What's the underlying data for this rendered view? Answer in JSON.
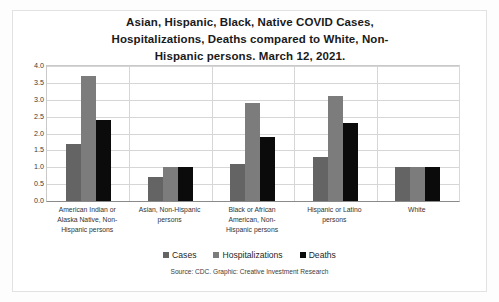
{
  "chart_data": {
    "type": "bar",
    "title_lines": [
      "Asian, Hispanic, Black, Native COVID Cases,",
      "Hospitalizations,  Deaths compared to White, Non-",
      "Hispanic persons. March 12, 2021."
    ],
    "xlabel": "",
    "ylabel": "",
    "ylim": [
      0,
      4.0
    ],
    "ytick_step": 0.5,
    "grid": true,
    "legend_position": "bottom",
    "categories": [
      "American Indian or Alaska Native, Non-Hispanic persons",
      "Asian, Non-Hispanic persons",
      "Black or African American, Non-Hispanic persons",
      "Hispanic or Latino persons",
      "White"
    ],
    "category_lines": [
      [
        "American Indian or",
        "Alaska Native, Non-",
        "Hispanic persons"
      ],
      [
        "Asian, Non-Hispanic",
        "persons"
      ],
      [
        "Black or African",
        "American, Non-",
        "Hispanic persons"
      ],
      [
        "Hispanic or Latino",
        "persons"
      ],
      [
        "White"
      ]
    ],
    "series": [
      {
        "name": "Cases",
        "color": "#646464",
        "values": [
          1.7,
          0.7,
          1.1,
          1.3,
          1.0
        ]
      },
      {
        "name": "Hospitalizations",
        "color": "#7c7c7c",
        "values": [
          3.7,
          1.0,
          2.9,
          3.1,
          1.0
        ]
      },
      {
        "name": "Deaths",
        "color": "#0b0b0b",
        "values": [
          2.4,
          1.0,
          1.9,
          2.3,
          1.0
        ]
      }
    ],
    "yticks": [
      "0.0",
      "0.5",
      "1.0",
      "1.5",
      "2.0",
      "2.5",
      "3.0",
      "3.5",
      "4.0"
    ],
    "source_note": "Source: CDC. Graphic: Creative Investment Research"
  }
}
